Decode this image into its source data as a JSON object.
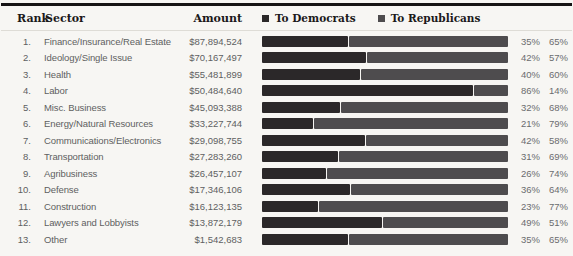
{
  "page": {
    "background": "#f7f6f3"
  },
  "colors": {
    "democrat_bar": "#2b2829",
    "republican_bar": "#4e4c4e",
    "top_rule": "#161415",
    "header_text": "#1b191a",
    "body_text": "#5e5f61"
  },
  "table": {
    "headers": {
      "rank": "Rank",
      "sector": "Sector",
      "amount": "Amount"
    },
    "rows": [
      {
        "rank": "1.",
        "sector": "Finance/Insurance/Real Estate",
        "amount": "$87,894,524",
        "dem": 35,
        "rep": 65,
        "dem_pct": "35%",
        "rep_pct": "65%"
      },
      {
        "rank": "2.",
        "sector": "Ideology/Single Issue",
        "amount": "$70,167,497",
        "dem": 42,
        "rep": 57,
        "dem_pct": "42%",
        "rep_pct": "57%"
      },
      {
        "rank": "3.",
        "sector": "Health",
        "amount": "$55,481,899",
        "dem": 40,
        "rep": 60,
        "dem_pct": "40%",
        "rep_pct": "60%"
      },
      {
        "rank": "4.",
        "sector": "Labor",
        "amount": "$50,484,640",
        "dem": 86,
        "rep": 14,
        "dem_pct": "86%",
        "rep_pct": "14%"
      },
      {
        "rank": "5.",
        "sector": "Misc. Business",
        "amount": "$45,093,388",
        "dem": 32,
        "rep": 68,
        "dem_pct": "32%",
        "rep_pct": "68%"
      },
      {
        "rank": "6.",
        "sector": "Energy/Natural Resources",
        "amount": "$33,227,744",
        "dem": 21,
        "rep": 79,
        "dem_pct": "21%",
        "rep_pct": "79%"
      },
      {
        "rank": "7.",
        "sector": "Communications/Electronics",
        "amount": "$29,098,755",
        "dem": 42,
        "rep": 58,
        "dem_pct": "42%",
        "rep_pct": "58%"
      },
      {
        "rank": "8.",
        "sector": "Transportation",
        "amount": "$27,283,260",
        "dem": 31,
        "rep": 69,
        "dem_pct": "31%",
        "rep_pct": "69%"
      },
      {
        "rank": "9.",
        "sector": "Agribusiness",
        "amount": "$26,457,107",
        "dem": 26,
        "rep": 74,
        "dem_pct": "26%",
        "rep_pct": "74%"
      },
      {
        "rank": "10.",
        "sector": "Defense",
        "amount": "$17,346,106",
        "dem": 36,
        "rep": 64,
        "dem_pct": "36%",
        "rep_pct": "64%"
      },
      {
        "rank": "11.",
        "sector": "Construction",
        "amount": "$16,123,135",
        "dem": 23,
        "rep": 77,
        "dem_pct": "23%",
        "rep_pct": "77%"
      },
      {
        "rank": "12.",
        "sector": "Lawyers and Lobbyists",
        "amount": "$13,872,179",
        "dem": 49,
        "rep": 51,
        "dem_pct": "49%",
        "rep_pct": "51%"
      },
      {
        "rank": "13.",
        "sector": "Other",
        "amount": "$1,542,683",
        "dem": 35,
        "rep": 65,
        "dem_pct": "35%",
        "rep_pct": "65%"
      }
    ]
  },
  "legend": {
    "items": [
      {
        "label": "To Democrats",
        "color": "#2b2829"
      },
      {
        "label": "To Republicans",
        "color": "#4e4c4e"
      }
    ]
  },
  "chart_data": {
    "type": "bar",
    "orientation": "horizontal",
    "stacked": true,
    "title": "",
    "xlabel": "Share of contributions (%)",
    "ylabel": "Sector",
    "xlim": [
      0,
      100
    ],
    "grid": false,
    "legend_position": "top",
    "categories": [
      "Finance/Insurance/Real Estate",
      "Ideology/Single Issue",
      "Health",
      "Labor",
      "Misc. Business",
      "Energy/Natural Resources",
      "Communications/Electronics",
      "Transportation",
      "Agribusiness",
      "Defense",
      "Construction",
      "Lawyers and Lobbyists",
      "Other"
    ],
    "ranks": [
      1,
      2,
      3,
      4,
      5,
      6,
      7,
      8,
      9,
      10,
      11,
      12,
      13
    ],
    "amounts": [
      87894524,
      70167497,
      55481899,
      50484640,
      45093388,
      33227744,
      29098755,
      27283260,
      26457107,
      17346106,
      16123135,
      13872179,
      1542683
    ],
    "series": [
      {
        "name": "To Democrats",
        "color": "#2b2829",
        "values": [
          35,
          42,
          40,
          86,
          32,
          21,
          42,
          31,
          26,
          36,
          23,
          49,
          35
        ]
      },
      {
        "name": "To Republicans",
        "color": "#4e4c4e",
        "values": [
          65,
          57,
          60,
          14,
          68,
          79,
          58,
          69,
          74,
          64,
          77,
          51,
          65
        ]
      }
    ]
  }
}
